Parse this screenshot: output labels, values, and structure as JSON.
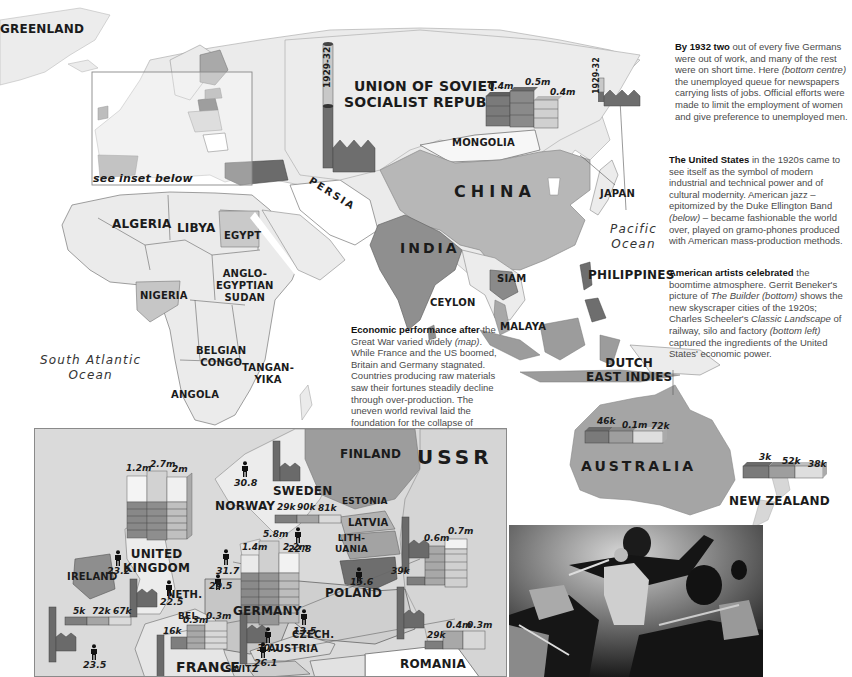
{
  "world_map": {
    "regions": {
      "greenland": "GREENLAND",
      "ussr": "UNION OF SOVIET SOCIALIST REPUBLICS",
      "ussr_line1": "UNION OF SOVIET",
      "ussr_line2": "SOCIALIST REPUBLICS",
      "mongolia": "MONGOLIA",
      "china": "CHINA",
      "japan": "JAPAN",
      "persia": "PERSIA",
      "india": "INDIA",
      "ceylon": "CEYLON",
      "siam": "SIAM",
      "philippines": "PHILIPPINES",
      "malaya": "MALAYA",
      "dutch_east_indies_1": "DUTCH",
      "dutch_east_indies_2": "EAST INDIES",
      "australia": "AUSTRALIA",
      "new_zealand": "NEW ZEALAND",
      "algeria": "ALGERIA",
      "libya": "LIBYA",
      "egypt": "EGYPT",
      "anglo_egyptian_sudan_1": "ANGLO-",
      "anglo_egyptian_sudan_2": "EGYPTIAN",
      "anglo_egyptian_sudan_3": "SUDAN",
      "nigeria": "NIGERIA",
      "belgian_congo_1": "BELGIAN",
      "belgian_congo_2": "CONGO",
      "tanganyika_1": "TANGAN-",
      "tanganyika_2": "YIKA",
      "angola": "ANGOLA"
    },
    "oceans": {
      "pacific_1": "Pacific",
      "pacific_2": "Ocean",
      "south_atlantic_1": "South Atlantic",
      "south_atlantic_2": "Ocean"
    },
    "inset_note": "see inset below",
    "year_range": "1929-32",
    "japan_year_range": "1929-32",
    "ussr_bars": [
      "0.4m",
      "0.5m",
      "0.4m"
    ],
    "australia_bars": [
      "46k",
      "0.1m",
      "72k"
    ],
    "new_zealand_bars": [
      "3k",
      "52k",
      "38k"
    ]
  },
  "inset_map": {
    "regions": {
      "finland": "FINLAND",
      "ussr": "USSR",
      "sweden": "SWEDEN",
      "norway": "NORWAY",
      "estonia": "ESTONIA",
      "latvia": "LATVIA",
      "lithuania_1": "LITH-",
      "lithuania_2": "UANIA",
      "united_kingdom_1": "UNITED",
      "united_kingdom_2": "KINGDOM",
      "ireland": "IRELAND",
      "germany": "GERMANY",
      "poland": "POLAND",
      "neth": "NETH.",
      "bel": "BEL.",
      "czech": "CZECH.",
      "austria": "AUSTRIA",
      "france": "FRANCE",
      "switz": "SWITZ",
      "romania": "ROMANIA"
    },
    "bars": {
      "uk": [
        "1.2m",
        "2.7m",
        "2m"
      ],
      "sweden": [
        "29k",
        "90k",
        "81k"
      ],
      "germany": [
        "1.4m",
        "5.8m",
        "2.2m"
      ],
      "poland": [
        "39k",
        "0.6m",
        "0.7m"
      ],
      "france": [
        "16k",
        "0.3m",
        "0.3m"
      ],
      "spain_portugal": [
        "5k",
        "72k",
        "67k"
      ],
      "romania": [
        "29k",
        "0.4m",
        "0.3m"
      ]
    },
    "people_stats": {
      "norway": "30.8",
      "sweden": "22.8",
      "germany_north": "31.7",
      "ireland": "23.2",
      "uk": "22.5",
      "neth": "29.5",
      "poland": "15.6",
      "germany": "30.1",
      "czech": "13.5",
      "austria": "26.1",
      "france": "23.5"
    }
  },
  "captions": {
    "germany": {
      "lead": "By 1932 two",
      "body": " out of every five Germans were out of work, and many of the rest were on short time. Here ",
      "ref": "(bottom centre)",
      "tail": " the unemployed queue for newspapers carrying lists of jobs. Official efforts were made to limit the employment of women and give preference to unemployed men."
    },
    "united_states": {
      "lead": "The United States",
      "body": " in the 1920s came to see itself as the symbol of modern industrial and technical power and of cultural modernity. American jazz – epitomized by the Duke Ellington Band ",
      "ref": "(below)",
      "tail": " – became fashionable the world over, played on gramo-phones produced with American mass-production methods."
    },
    "artists": {
      "lead": "American artists celebrated",
      "body": " the boomtime atmosphere. Gerrit Beneker's picture of ",
      "title1": "The Builder",
      "ref1": "(bottom)",
      "body2": " shows the new skyscraper cities of the 1920s; Charles Scheeler's ",
      "title2": "Classic Landscape",
      "body3": " of railway, silo and factory ",
      "ref2": "(bottom left)",
      "tail": " captured the ingredients of the United States' economic power."
    },
    "economic": {
      "lead": "Economic performance after",
      "body": " the Great War varied widely ",
      "ref": "(map)",
      "tail": ". While France and the US boomed, Britain and Germany stagnated. Countries producing raw materials saw their fortunes steadily decline through over-production. The uneven world revival laid the foundation for the collapse of 1929."
    }
  },
  "photo": {
    "subject": "Duke Ellington Band photograph"
  },
  "colors": {
    "land": "#e9e9e9",
    "mid_gray": "#a8a8a8",
    "dark_gray": "#6e6e6e",
    "light_gray": "#cfcfcf",
    "bar_dark": "#7a7a7a",
    "bar_mid": "#a0a0a0",
    "bar_light": "#d8d8d8"
  }
}
